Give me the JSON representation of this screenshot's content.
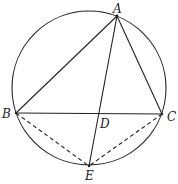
{
  "diagram": {
    "type": "circle-inscribed-triangle",
    "circle": {
      "cx": 89,
      "cy": 88,
      "r": 77
    },
    "points": {
      "A": {
        "x": 117,
        "y": 16,
        "label": "A",
        "lx": 113,
        "ly": 13
      },
      "B": {
        "x": 16,
        "y": 113,
        "label": "B",
        "lx": 2,
        "ly": 118
      },
      "C": {
        "x": 162,
        "y": 114,
        "label": "C",
        "lx": 167,
        "ly": 121
      },
      "D": {
        "x": 99,
        "y": 114,
        "label": "D",
        "lx": 100,
        "ly": 128
      },
      "E": {
        "x": 89,
        "y": 166,
        "label": "E",
        "lx": 85,
        "ly": 180
      }
    },
    "solid_segments": [
      "AB",
      "AC",
      "BC",
      "AE"
    ],
    "dashed_segments": [
      "BE",
      "CE"
    ],
    "stroke_color": "#222222"
  }
}
